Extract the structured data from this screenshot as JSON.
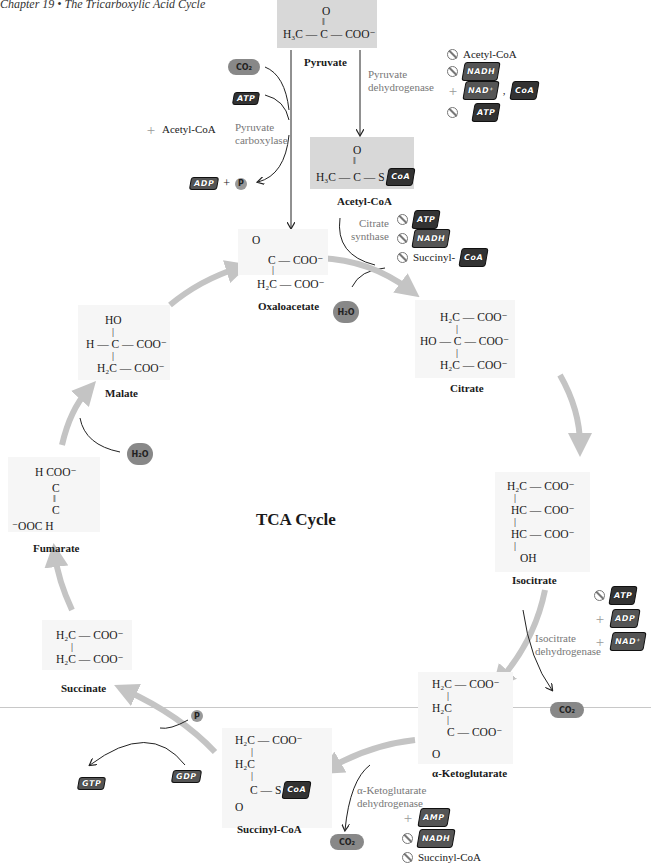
{
  "header": "Chapter 19  •  The Tricarboxylic Acid Cycle",
  "cycle_title": "TCA Cycle",
  "metabolites": {
    "pyruvate": {
      "name": "Pyruvate",
      "line1": "O",
      "line2": "‖",
      "line3": "H₃C — C — COO⁻"
    },
    "acetyl_coa": {
      "name": "Acetyl-CoA",
      "line1": "O",
      "line2": "‖",
      "line3": "H₃C — C — S",
      "coa": "CoA"
    },
    "oxaloacetate": {
      "name": "Oxaloacetate",
      "line1": "O",
      "line2": "C — COO⁻",
      "line3": "|",
      "line4": "H₂C — COO⁻"
    },
    "citrate": {
      "name": "Citrate",
      "line1": "H₂C — COO⁻",
      "line2": "|",
      "line3": "HO — C — COO⁻",
      "line4": "|",
      "line5": "H₂C — COO⁻"
    },
    "isocitrate": {
      "name": "Isocitrate",
      "line1": "H₂C — COO⁻",
      "line2": "|",
      "line3": "HC — COO⁻",
      "line4": "|",
      "line5": "HC — COO⁻",
      "line6": "|",
      "line7": "OH"
    },
    "alpha_ketoglutarate": {
      "name": "α-Ketoglutarate",
      "line1": "H₂C — COO⁻",
      "line2": "|",
      "line3": "H₂C",
      "line4": "|",
      "line5": "C — COO⁻",
      "line6": "O"
    },
    "succinyl_coa": {
      "name": "Succinyl-CoA",
      "line1": "H₂C — COO⁻",
      "line2": "|",
      "line3": "H₂C",
      "line4": "|",
      "line5": "C — S",
      "line6": "O",
      "coa": "CoA"
    },
    "succinate": {
      "name": "Succinate",
      "line1": "H₂C — COO⁻",
      "line2": "|",
      "line3": "H₂C — COO⁻"
    },
    "fumarate": {
      "name": "Fumarate",
      "line1": "H        COO⁻",
      "line2": "C",
      "line3": "‖",
      "line4": "C",
      "line5": "⁻OOC        H"
    },
    "malate": {
      "name": "Malate",
      "line1": "HO",
      "line2": "|",
      "line3": "H — C — COO⁻",
      "line4": "|",
      "line5": "H₂C — COO⁻"
    }
  },
  "enzymes": {
    "pyruvate_carboxylase": {
      "line1": "Pyruvate",
      "line2": "carboxylase"
    },
    "pyruvate_dehydrogenase": {
      "line1": "Pyruvate",
      "line2": "dehydrogenase"
    },
    "citrate_synthase": {
      "line1": "Citrate",
      "line2": "synthase"
    },
    "isocitrate_dehydrogenase": {
      "line1": "Isocitrate",
      "line2": "dehydrogenase"
    },
    "akg_dehydrogenase": {
      "line1": "α-Ketoglutarate",
      "line2": "dehydrogenase"
    }
  },
  "regulators": {
    "pyruvate_carboxylase": [
      {
        "type": "activator",
        "label": "Acetyl-CoA"
      }
    ],
    "pyruvate_dehydrogenase": [
      {
        "type": "inhibitor",
        "label": "Acetyl-CoA"
      },
      {
        "type": "inhibitor",
        "label": "NADH"
      },
      {
        "type": "activator",
        "label": "NAD⁺",
        "extra": "CoA"
      },
      {
        "type": "inhibitor",
        "label": "ATP"
      }
    ],
    "citrate_synthase": [
      {
        "type": "inhibitor",
        "label": "ATP"
      },
      {
        "type": "inhibitor",
        "label": "NADH"
      },
      {
        "type": "inhibitor",
        "label": "Succinyl-",
        "extra": "CoA"
      }
    ],
    "isocitrate_dehydrogenase": [
      {
        "type": "inhibitor",
        "label": "ATP"
      },
      {
        "type": "activator",
        "label": "ADP"
      },
      {
        "type": "activator",
        "label": "NAD⁺"
      }
    ],
    "akg_dehydrogenase": [
      {
        "type": "activator",
        "label": "AMP"
      },
      {
        "type": "inhibitor",
        "label": "NADH"
      },
      {
        "type": "inhibitor",
        "label": "Succinyl-CoA"
      }
    ]
  },
  "small_molecules": {
    "co2": "CO₂",
    "atp": "ATP",
    "adp": "ADP",
    "pi": "P",
    "plus": "+",
    "h2o": "H₂O",
    "gdp": "GDP",
    "gtp": "GTP"
  },
  "colors": {
    "arrow": "#c4c4c4",
    "box": "#d8d8d8",
    "enzyme_text": "#777777",
    "molecule": "#888888"
  }
}
